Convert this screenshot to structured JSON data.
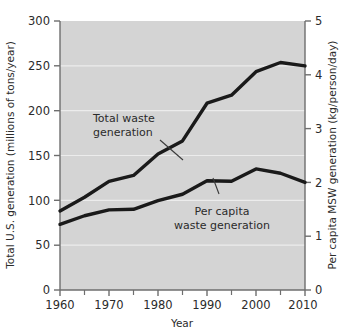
{
  "chart_data": {
    "type": "line",
    "title": "",
    "xlabel": "Year",
    "ylabel": "Total U.S. generation (millions of tons/year)",
    "y2label": "Per capita MSW generation (kg/person/day)",
    "xlim": [
      1960,
      2010
    ],
    "ylim": [
      0,
      300
    ],
    "y2lim": [
      0,
      5
    ],
    "grid": true,
    "grid_axis": "y",
    "legend": "none",
    "plot_background": "#d4d4d4",
    "line_color": "#1a1a1a",
    "xticks": [
      1960,
      1970,
      1980,
      1990,
      2000,
      2010
    ],
    "xtick_labels": [
      "1960",
      "1970",
      "1980",
      "1990",
      "2000",
      "2010"
    ],
    "xminor_ticks": [
      1965,
      1975,
      1985,
      1995,
      2005
    ],
    "yticks": [
      0,
      50,
      100,
      150,
      200,
      250,
      300
    ],
    "ytick_labels": [
      "0",
      "50",
      "100",
      "150",
      "200",
      "250",
      "300"
    ],
    "y2ticks": [
      0,
      1,
      2,
      3,
      4,
      5
    ],
    "y2tick_labels": [
      "0",
      "1",
      "2",
      "3",
      "4",
      "5"
    ],
    "x": [
      1960,
      1965,
      1970,
      1975,
      1980,
      1985,
      1990,
      1995,
      2000,
      2005,
      2010
    ],
    "series": [
      {
        "name": "Total waste generation",
        "axis": "left",
        "units": "millions of tons/year",
        "values": [
          88.1,
          103.4,
          121.1,
          127.8,
          151.6,
          166.3,
          208.3,
          217.3,
          243.5,
          253.7,
          249.9
        ]
      },
      {
        "name": "Per capita waste generation",
        "axis": "right",
        "units": "kg/person/day",
        "values": [
          1.22,
          1.38,
          1.49,
          1.5,
          1.66,
          1.78,
          2.03,
          2.02,
          2.25,
          2.17,
          2.0
        ]
      }
    ],
    "annotations": [
      {
        "id": "total-waste-annotation",
        "line1": "Total waste",
        "line2": "generation",
        "text": "Total waste generation"
      },
      {
        "id": "per-capita-annotation",
        "line1": "Per capita",
        "line2": "waste generation",
        "text": "Per capita waste generation"
      }
    ]
  }
}
